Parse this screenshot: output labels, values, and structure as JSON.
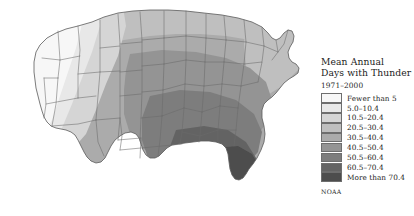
{
  "figure": {
    "background_color": "#ffffff",
    "source": "NOAA"
  },
  "legend": {
    "title_line1": "Mean Annual",
    "title_line2": "Days with Thunder",
    "subtitle": "1971–2000",
    "source_label": "NOAA",
    "entries": [
      {
        "label": "Fewer than 5",
        "color": "#f7f7f7"
      },
      {
        "label": "5.0–10.4",
        "color": "#e8e8e8"
      },
      {
        "label": "10.5–20.4",
        "color": "#d5d5d5"
      },
      {
        "label": "20.5–30.4",
        "color": "#bfbfbf"
      },
      {
        "label": "30.5–40.4",
        "color": "#ababab"
      },
      {
        "label": "40.5–50.4",
        "color": "#949494"
      },
      {
        "label": "50.5–60.4",
        "color": "#7d7d7d"
      },
      {
        "label": "60.5–70.4",
        "color": "#646464"
      },
      {
        "label": "More than 70.4",
        "color": "#4d4d4d"
      }
    ]
  },
  "chart_data": {
    "type": "heatmap",
    "subtype": "choropleth-map",
    "title": "Mean Annual Days with Thunder",
    "subtitle": "1971–2000",
    "region": "Contiguous United States",
    "units": "days per year",
    "source": "NOAA",
    "legend_position": "right",
    "grid": false,
    "color_scale": "grayscale-sequential-light-to-dark",
    "class_breaks": [
      0,
      5,
      10.5,
      20.5,
      30.5,
      40.5,
      50.5,
      60.5,
      70.4
    ],
    "class_labels": [
      "Fewer than 5",
      "5.0–10.4",
      "10.5–20.4",
      "20.5–30.4",
      "30.5–40.4",
      "40.5–50.4",
      "50.5–60.4",
      "60.5–70.4",
      "More than 70.4"
    ],
    "class_colors": [
      "#f7f7f7",
      "#e8e8e8",
      "#d5d5d5",
      "#bfbfbf",
      "#ababab",
      "#949494",
      "#7d7d7d",
      "#646464",
      "#4d4d4d"
    ],
    "regional_readings": [
      {
        "region": "Pacific Northwest (WA, OR)",
        "class_index": 0,
        "label": "Fewer than 5"
      },
      {
        "region": "Northern California / Nevada",
        "class_index": 0,
        "label": "Fewer than 5"
      },
      {
        "region": "Southern California",
        "class_index": 0,
        "label": "Fewer than 5"
      },
      {
        "region": "Idaho",
        "class_index": 1,
        "label": "5.0–10.4"
      },
      {
        "region": "Great Basin / Utah",
        "class_index": 2,
        "label": "10.5–20.4"
      },
      {
        "region": "Montana",
        "class_index": 3,
        "label": "20.5–30.4"
      },
      {
        "region": "Arizona",
        "class_index": 4,
        "label": "30.5–40.4"
      },
      {
        "region": "New Mexico",
        "class_index": 5,
        "label": "40.5–50.4"
      },
      {
        "region": "Colorado Front Range",
        "class_index": 5,
        "label": "40.5–50.4"
      },
      {
        "region": "Northern Plains (ND, SD)",
        "class_index": 3,
        "label": "20.5–30.4"
      },
      {
        "region": "Nebraska / Kansas",
        "class_index": 5,
        "label": "40.5–50.4"
      },
      {
        "region": "Oklahoma",
        "class_index": 6,
        "label": "50.5–60.4"
      },
      {
        "region": "Texas Panhandle",
        "class_index": 5,
        "label": "40.5–50.4"
      },
      {
        "region": "South Texas",
        "class_index": 4,
        "label": "30.5–40.4"
      },
      {
        "region": "Upper Midwest (MN, WI)",
        "class_index": 4,
        "label": "30.5–40.4"
      },
      {
        "region": "Great Lakes / Michigan",
        "class_index": 4,
        "label": "30.5–40.4"
      },
      {
        "region": "Ohio Valley",
        "class_index": 5,
        "label": "40.5–50.4"
      },
      {
        "region": "Missouri / Arkansas",
        "class_index": 6,
        "label": "50.5–60.4"
      },
      {
        "region": "Northeast (New England)",
        "class_index": 3,
        "label": "20.5–30.4"
      },
      {
        "region": "Mid-Atlantic",
        "class_index": 4,
        "label": "30.5–40.4"
      },
      {
        "region": "Southeast (GA, SC, AL)",
        "class_index": 6,
        "label": "50.5–60.4"
      },
      {
        "region": "Gulf Coast (LA, MS)",
        "class_index": 7,
        "label": "60.5–70.4"
      },
      {
        "region": "Florida peninsula",
        "class_index": 8,
        "label": "More than 70.4"
      },
      {
        "region": "Central Florida",
        "class_index": 8,
        "label": "More than 70.4"
      }
    ]
  }
}
